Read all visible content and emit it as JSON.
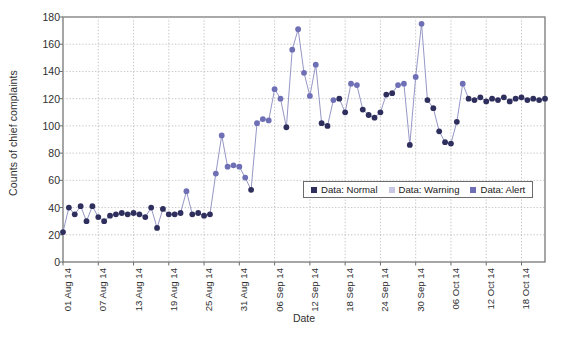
{
  "chart_data": {
    "type": "scatter",
    "title": "",
    "xlabel": "Date",
    "ylabel": "Counts of chief complaints",
    "ylim": [
      0,
      180
    ],
    "ytick_values": [
      0,
      20,
      40,
      60,
      80,
      100,
      120,
      140,
      160,
      180
    ],
    "grid": true,
    "legend_position": "inside-center-right",
    "legend": [
      {
        "label": "Data: Normal",
        "color": "#2f2f5e"
      },
      {
        "label": "Data: Warning",
        "color": "#c9c8e4"
      },
      {
        "label": "Data: Alert",
        "color": "#6f6fb5"
      }
    ],
    "xtick_labels": [
      "01 Aug 14",
      "07 Aug 14",
      "13 Aug 14",
      "19 Aug 14",
      "25 Aug 14",
      "31 Aug 14",
      "06 Sep 14",
      "12 Sep 14",
      "18 Sep 14",
      "24 Sep 14",
      "30 Sep 14",
      "06 Oct 14",
      "12 Oct 14",
      "18 Oct 14"
    ],
    "xtick_indices": [
      0,
      6,
      12,
      18,
      24,
      30,
      36,
      42,
      48,
      54,
      60,
      66,
      72,
      78
    ],
    "x_index_max": 82,
    "x": [
      0,
      1,
      2,
      3,
      4,
      5,
      6,
      7,
      8,
      9,
      10,
      11,
      12,
      13,
      14,
      15,
      16,
      17,
      18,
      19,
      20,
      21,
      22,
      23,
      24,
      25,
      26,
      27,
      28,
      29,
      30,
      31,
      32,
      33,
      34,
      35,
      36,
      37,
      38,
      39,
      40,
      41,
      42,
      43,
      44,
      45,
      46,
      47,
      48,
      49,
      50,
      51,
      52,
      53,
      54,
      55,
      56,
      57,
      58,
      59,
      60,
      61,
      62,
      63,
      64,
      65,
      66,
      67,
      68,
      69,
      70,
      71,
      72,
      73,
      74,
      75,
      76,
      77,
      78,
      79,
      80,
      81,
      82
    ],
    "y": [
      22,
      40,
      35,
      41,
      30,
      41,
      33,
      30,
      34,
      35,
      36,
      35,
      36,
      35,
      33,
      40,
      25,
      39,
      35,
      35,
      36,
      52,
      35,
      36,
      34,
      35,
      65,
      93,
      70,
      71,
      70,
      62,
      53,
      102,
      105,
      104,
      127,
      120,
      99,
      156,
      171,
      139,
      122,
      145,
      102,
      100,
      119,
      120,
      110,
      131,
      130,
      112,
      108,
      106,
      110,
      123,
      124,
      130,
      131,
      86,
      136,
      175,
      119,
      113,
      96,
      88,
      87,
      103,
      131,
      120,
      119,
      121,
      118,
      120,
      119,
      121,
      118,
      120,
      121,
      119,
      120,
      119,
      120
    ],
    "series_class": [
      "normal",
      "normal",
      "normal",
      "normal",
      "normal",
      "normal",
      "normal",
      "normal",
      "normal",
      "normal",
      "normal",
      "normal",
      "normal",
      "normal",
      "normal",
      "normal",
      "normal",
      "normal",
      "normal",
      "normal",
      "normal",
      "alert",
      "normal",
      "normal",
      "normal",
      "normal",
      "alert",
      "alert",
      "alert",
      "alert",
      "alert",
      "alert",
      "normal",
      "alert",
      "alert",
      "alert",
      "alert",
      "alert",
      "normal",
      "alert",
      "alert",
      "alert",
      "alert",
      "alert",
      "normal",
      "normal",
      "alert",
      "normal",
      "normal",
      "alert",
      "alert",
      "normal",
      "normal",
      "normal",
      "normal",
      "normal",
      "normal",
      "alert",
      "alert",
      "normal",
      "alert",
      "alert",
      "normal",
      "normal",
      "normal",
      "normal",
      "normal",
      "normal",
      "alert",
      "normal",
      "normal",
      "normal",
      "normal",
      "normal",
      "normal",
      "normal",
      "normal",
      "normal",
      "normal",
      "normal",
      "normal",
      "normal",
      "normal"
    ]
  },
  "style": {
    "line_color": "#8a8ac0",
    "normal_color": "#2f2f5e",
    "warning_color": "#c9c8e4",
    "alert_color": "#6f6fb5",
    "grid_color": "#b9b9b9",
    "axis_color": "#6b6b6b"
  }
}
